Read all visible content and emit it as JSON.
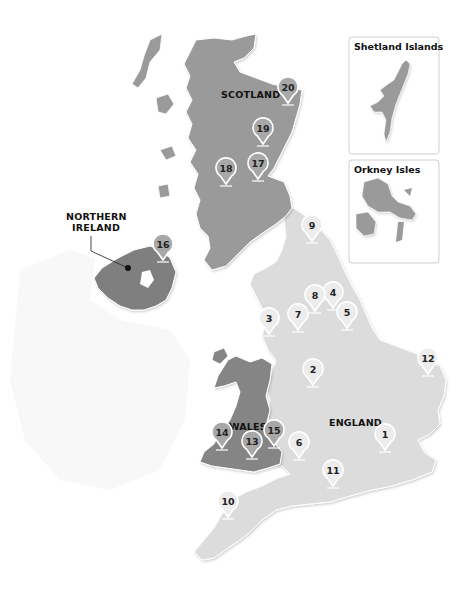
{
  "map": {
    "colors": {
      "background": "#ffffff",
      "scotland": "#9a9a9a",
      "northern_ireland": "#7f7f7f",
      "wales": "#858585",
      "england": "#dcdcdc",
      "ireland_ghost": "#f7f7f7",
      "pin_fill_light": "#ececec",
      "pin_fill_dark": "#a8a8a8",
      "pin_stroke": "#ffffff",
      "inset_border": "#cfcfcf",
      "leader_line": "#333333"
    },
    "regions": [
      {
        "id": "scotland",
        "label": "SCOTLAND"
      },
      {
        "id": "northern-ireland",
        "label_lines": [
          "NORTHERN",
          "IRELAND"
        ]
      },
      {
        "id": "wales",
        "label": "WALES"
      },
      {
        "id": "england",
        "label": "ENGLAND"
      }
    ],
    "labels": {
      "scotland": "SCOTLAND",
      "ni_line1": "NORTHERN",
      "ni_line2": "IRELAND",
      "wales": "WALES",
      "england": "ENGLAND"
    },
    "insets": {
      "shetland": {
        "title": "Shetland Islands"
      },
      "orkney": {
        "title": "Orkney Isles"
      }
    },
    "pins": [
      {
        "number": "1",
        "region": "england",
        "x": 385,
        "y": 452
      },
      {
        "number": "2",
        "region": "england",
        "x": 313,
        "y": 387
      },
      {
        "number": "3",
        "region": "england",
        "x": 269,
        "y": 336
      },
      {
        "number": "4",
        "region": "england",
        "x": 333,
        "y": 310
      },
      {
        "number": "5",
        "region": "england",
        "x": 347,
        "y": 330
      },
      {
        "number": "6",
        "region": "england",
        "x": 299,
        "y": 460
      },
      {
        "number": "7",
        "region": "england",
        "x": 298,
        "y": 332
      },
      {
        "number": "8",
        "region": "england",
        "x": 315,
        "y": 313
      },
      {
        "number": "9",
        "region": "england",
        "x": 312,
        "y": 243
      },
      {
        "number": "10",
        "region": "england",
        "x": 228,
        "y": 519
      },
      {
        "number": "11",
        "region": "england",
        "x": 333,
        "y": 488
      },
      {
        "number": "12",
        "region": "england",
        "x": 428,
        "y": 376
      },
      {
        "number": "13",
        "region": "wales",
        "x": 252,
        "y": 459
      },
      {
        "number": "14",
        "region": "wales",
        "x": 222,
        "y": 450
      },
      {
        "number": "15",
        "region": "wales",
        "x": 274,
        "y": 448
      },
      {
        "number": "16",
        "region": "northern-ireland",
        "x": 163,
        "y": 262
      },
      {
        "number": "17",
        "region": "scotland",
        "x": 258,
        "y": 181
      },
      {
        "number": "18",
        "region": "scotland",
        "x": 226,
        "y": 186
      },
      {
        "number": "19",
        "region": "scotland",
        "x": 263,
        "y": 146
      },
      {
        "number": "20",
        "region": "scotland",
        "x": 288,
        "y": 105
      }
    ]
  }
}
